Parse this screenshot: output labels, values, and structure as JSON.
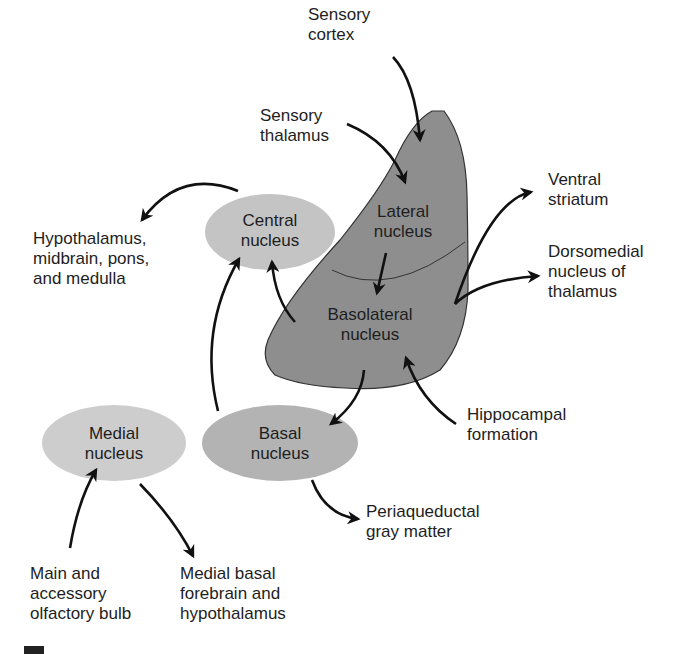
{
  "colors": {
    "amygdala_fill": "#8e8e8e",
    "central_fill": "#c4c4c4",
    "medial_fill": "#cdcdcd",
    "basal_fill": "#b3b3b3",
    "arrow": "#111111",
    "text": "#1e1e1e"
  },
  "nodes": {
    "lateral": "Lateral\nnucleus",
    "basolateral": "Basolateral\nnucleus",
    "central": "Central\nnucleus",
    "basal": "Basal\nnucleus",
    "medial": "Medial\nnucleus"
  },
  "labels": {
    "sensory_cortex": "Sensory\ncortex",
    "sensory_thalamus": "Sensory\nthalamus",
    "hypothalamus": "Hypothalamus,\nmidbrain, pons,\nand medulla",
    "ventral_striatum": "Ventral\nstriatum",
    "dorsomedial": "Dorsomedial\nnucleus of\nthalamus",
    "hippocampal": "Hippocampal\nformation",
    "periaqueductal": "Periaqueductal\ngray matter",
    "olfactory": "Main and\naccessory\nolfactory bulb",
    "medial_basal": "Medial basal\nforebrain and\nhypothalamus"
  },
  "edges": [
    {
      "from": "Sensory cortex",
      "to": "Lateral nucleus"
    },
    {
      "from": "Sensory thalamus",
      "to": "Lateral nucleus"
    },
    {
      "from": "Lateral nucleus",
      "to": "Basolateral nucleus"
    },
    {
      "from": "Basolateral nucleus",
      "to": "Central nucleus"
    },
    {
      "from": "Basolateral nucleus",
      "to": "Ventral striatum"
    },
    {
      "from": "Basolateral nucleus",
      "to": "Dorsomedial nucleus of thalamus"
    },
    {
      "from": "Basolateral nucleus",
      "to": "Basal nucleus"
    },
    {
      "from": "Hippocampal formation",
      "to": "Basolateral nucleus"
    },
    {
      "from": "Central nucleus",
      "to": "Hypothalamus, midbrain, pons, and medulla"
    },
    {
      "from": "Basal nucleus",
      "to": "Central nucleus"
    },
    {
      "from": "Basal nucleus",
      "to": "Periaqueductal gray matter"
    },
    {
      "from": "Main and accessory olfactory bulb",
      "to": "Medial nucleus"
    },
    {
      "from": "Medial nucleus",
      "to": "Medial basal forebrain and hypothalamus"
    }
  ]
}
